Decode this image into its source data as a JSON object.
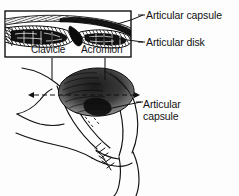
{
  "figure": {
    "background_color": "#fdfdfd",
    "ink_color": "#111111",
    "inset": {
      "name": "sectional-inset",
      "border_color": "#111111",
      "labels": {
        "clavicle": "Clavicle",
        "acromion": "Acromion"
      }
    },
    "callouts": {
      "articular_capsule_top": "Articular capsule",
      "articular_disk": "Articular disk",
      "articular_capsule_bottom_line1": "Articular",
      "articular_capsule_bottom_line2": "capsule"
    },
    "section_indicator": {
      "name": "section-plane-dashed-arrow",
      "style": "dashed double-headed arrow"
    }
  }
}
